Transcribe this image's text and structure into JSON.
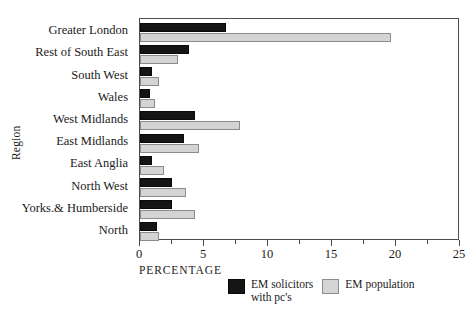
{
  "chart_data": {
    "type": "bar",
    "orientation": "horizontal",
    "title": "",
    "xlabel": "PERCENTAGE",
    "ylabel": "Region",
    "xlim": [
      0,
      25
    ],
    "xticks": [
      0,
      5,
      10,
      15,
      20,
      25
    ],
    "xtick_labels": [
      "0",
      "5",
      "10",
      "15",
      "20",
      "25"
    ],
    "minor_tick_step": 2.5,
    "grid": false,
    "legend_position": "below-axes",
    "categories": [
      "Greater London",
      "Rest of South East",
      "South West",
      "Wales",
      "West Midlands",
      "East Midlands",
      "East Anglia",
      "North West",
      "Yorks.& Humberside",
      "North"
    ],
    "series": [
      {
        "name": "EM solicitors with pc's",
        "color": "#151515",
        "values": [
          6.7,
          3.8,
          0.9,
          0.8,
          4.3,
          3.4,
          0.9,
          2.5,
          2.5,
          1.3
        ]
      },
      {
        "name": "EM population",
        "color": "#d4d4d4",
        "values": [
          19.6,
          3.0,
          1.5,
          1.2,
          7.8,
          4.6,
          1.9,
          3.6,
          4.3,
          1.5
        ]
      }
    ]
  },
  "legend": {
    "entries": [
      {
        "label_line1": "EM solicitors",
        "label_line2": "with pc's"
      },
      {
        "label_line1": "EM population",
        "label_line2": ""
      }
    ]
  }
}
